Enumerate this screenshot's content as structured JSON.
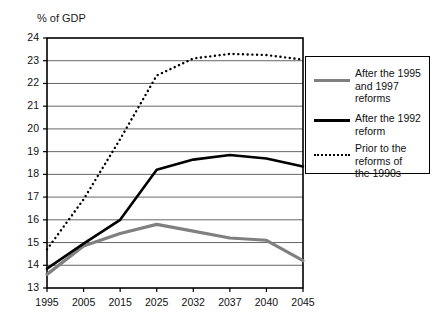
{
  "chart_data": {
    "type": "line",
    "title": "",
    "subtitle": "",
    "ylabel": "% of GDP",
    "xlabel": "",
    "ylim": [
      13,
      24
    ],
    "ytick_step": 1,
    "yticks": [
      "13",
      "14",
      "15",
      "16",
      "17",
      "18",
      "19",
      "20",
      "21",
      "22",
      "23",
      "24"
    ],
    "categories": [
      "1995",
      "2005",
      "2015",
      "2025",
      "2032",
      "2037",
      "2040",
      "2045"
    ],
    "xticks": [
      "1995",
      "2005",
      "2015",
      "2025",
      "2032",
      "2037",
      "2040",
      "2045"
    ],
    "grid": "horizontal",
    "legend_position": "right",
    "series": [
      {
        "name": "After the 1995 and 1997 reforms",
        "style": "solid",
        "color": "#808080",
        "width": 3.2,
        "values": [
          13.6,
          14.85,
          15.4,
          15.8,
          15.5,
          15.2,
          15.1,
          14.2
        ],
        "x": [
          1995,
          2005,
          2015,
          2025,
          2032,
          2037,
          2040,
          2045
        ]
      },
      {
        "name": "After the 1992 reform",
        "style": "solid",
        "color": "#000000",
        "width": 2.6,
        "values": [
          13.85,
          14.95,
          16.0,
          18.2,
          18.65,
          18.85,
          18.7,
          18.35
        ],
        "x": [
          1995,
          2005,
          2015,
          2025,
          2032,
          2037,
          2040,
          2045
        ]
      },
      {
        "name": "Prior to the reforms of the 1990s",
        "style": "dotted",
        "color": "#000000",
        "width": 2.4,
        "values": [
          14.7,
          16.9,
          19.55,
          22.35,
          23.1,
          23.3,
          23.25,
          23.05
        ],
        "x": [
          1995,
          2005,
          2015,
          2025,
          2032,
          2037,
          2040,
          2045
        ]
      }
    ]
  },
  "legend": {
    "entries": [
      {
        "label": "After the 1995\nand 1997\nreforms",
        "swatch": "solid-gray"
      },
      {
        "label": "After the 1992\nreform",
        "swatch": "solid-black"
      },
      {
        "label": "Prior to the\nreforms of\nthe 1990s",
        "swatch": "dotted-black"
      }
    ]
  },
  "colors": {
    "axis": "#000000",
    "grid": "#555555",
    "series_gray": "#808080",
    "series_black": "#000000",
    "background": "#ffffff"
  }
}
